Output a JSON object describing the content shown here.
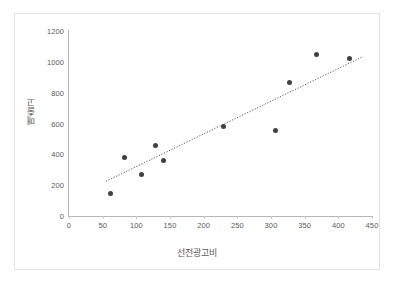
{
  "chart_data": {
    "type": "scatter",
    "title": "",
    "xlabel": "선전광고비",
    "ylabel": "매출고",
    "xlim": [
      0,
      450
    ],
    "ylim": [
      0,
      1200
    ],
    "xticks": [
      "0",
      "50",
      "100",
      "150",
      "200",
      "250",
      "300",
      "350",
      "400",
      "450"
    ],
    "yticks": [
      "0",
      "200",
      "400",
      "600",
      "800",
      "1000",
      "1200"
    ],
    "grid": false,
    "legend": "none",
    "marker_color": "#404040",
    "trendline": {
      "present": true,
      "style": "dotted",
      "color": "#595959",
      "x_start": 55,
      "y_start": 225,
      "x_end": 437,
      "y_end": 1035
    },
    "points": [
      {
        "x": 61,
        "y": 145
      },
      {
        "x": 83,
        "y": 381
      },
      {
        "x": 108,
        "y": 272
      },
      {
        "x": 128,
        "y": 456
      },
      {
        "x": 141,
        "y": 359
      },
      {
        "x": 229,
        "y": 583
      },
      {
        "x": 306,
        "y": 557
      },
      {
        "x": 327,
        "y": 864
      },
      {
        "x": 367,
        "y": 1050
      },
      {
        "x": 416,
        "y": 1024
      }
    ]
  }
}
